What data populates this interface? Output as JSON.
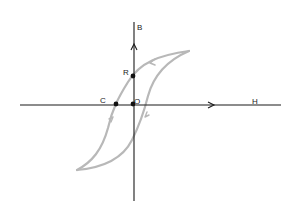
{
  "diagram": {
    "type": "hysteresis-loop",
    "axes": {
      "x_label": "H",
      "y_label": "B"
    },
    "points": [
      {
        "id": "C",
        "label": "C",
        "meaning": "coercivity"
      },
      {
        "id": "O",
        "label": "O",
        "meaning": "origin"
      },
      {
        "id": "R",
        "label": "R",
        "meaning": "retentivity"
      }
    ],
    "colors": {
      "axis": "#1a1a1a",
      "loop": "#b8b8b8",
      "point": "#111111"
    }
  }
}
